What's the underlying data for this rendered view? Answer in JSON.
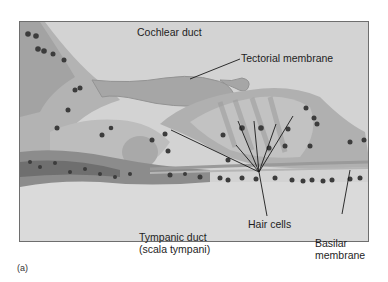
{
  "figure": {
    "panel_label": "(a)",
    "labels": {
      "cochlear_duct": "Cochlear duct",
      "tectorial_membrane": "Tectorial membrane",
      "hair_cells": "Hair cells",
      "tympanic_duct_line1": "Tympanic duct",
      "tympanic_duct_line2": "(scala tympani)",
      "basilar_membrane_line1": "Basilar",
      "basilar_membrane_line2": "membrane"
    },
    "colors": {
      "background": "#d2d2d2",
      "tissue": "#a9a9a9",
      "tissue_dark": "#8a8a8a",
      "nucleus": "#3c3c3c",
      "leader_line": "#1a1a1a",
      "frame": "#6e6e6e"
    }
  }
}
